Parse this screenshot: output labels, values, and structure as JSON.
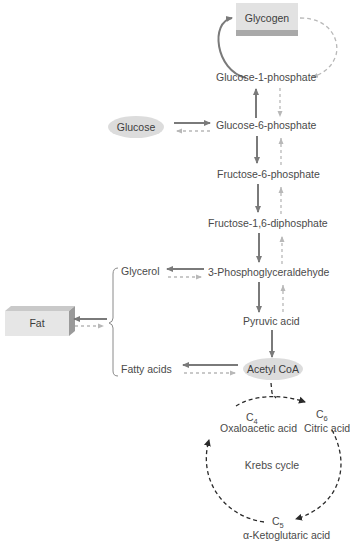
{
  "diagram": {
    "title": "",
    "colors": {
      "solid_arrow": "#7a7a7a",
      "dashed_arrow": "#b8b8b8",
      "krebs_arrow": "#2a2a2a",
      "box_fill": "#e4e4e4",
      "box_shadow": "#a8a8a8",
      "ellipse_fill": "#dcdcdc",
      "text": "#4a4a4a"
    },
    "nodes": {
      "glycogen": "Glycogen",
      "glucose_1_phosphate": "Glucose-1-phosphate",
      "glucose": "Glucose",
      "glucose_6_phosphate": "Glucose-6-phosphate",
      "fructose_6_phosphate": "Fructose-6-phosphate",
      "fructose_1_6_diphosphate": "Fructose-1,6-diphosphate",
      "glycerol": "Glycerol",
      "phosphoglyceraldehyde": "3-Phosphoglyceraldehyde",
      "fat": "Fat",
      "pyruvic_acid": "Pyruvic acid",
      "fatty_acids": "Fatty acids",
      "acetyl_coa": "Acetyl CoA"
    },
    "krebs": {
      "center_label": "Krebs cycle",
      "oxaloacetic": {
        "carbon": "C",
        "sub": "4",
        "name": "Oxaloacetic acid"
      },
      "citric": {
        "carbon": "C",
        "sub": "6",
        "name": "Citric acid"
      },
      "ketoglutaric": {
        "carbon": "C",
        "sub": "5",
        "name": "α-Ketoglutaric acid"
      }
    }
  }
}
